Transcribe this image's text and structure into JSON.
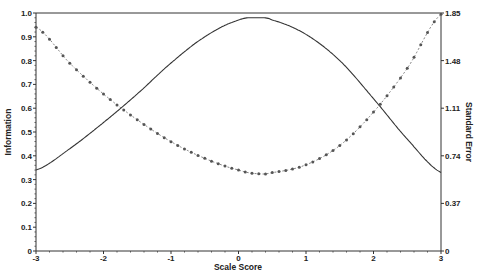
{
  "chart_data": {
    "type": "line",
    "title": "",
    "xlabel": "Scale Score",
    "ylabel": "Information",
    "y2label": "Standard Error",
    "xlim": [
      -3,
      3
    ],
    "ylim": [
      0,
      1.0
    ],
    "y2lim": [
      0,
      1.85
    ],
    "xticks": [
      "-3",
      "-2",
      "-1",
      "0",
      "1",
      "2",
      "3"
    ],
    "yticks": [
      "0",
      "0.1",
      "0.2",
      "0.3",
      "0.4",
      "0.5",
      "0.6",
      "0.7",
      "0.8",
      "0.9",
      "1.0"
    ],
    "y2ticks": [
      "0",
      "0.37",
      "0.74",
      "1.11",
      "1.48",
      "1.85"
    ],
    "grid": false,
    "legend": null,
    "x": [
      -3,
      -2.5,
      -2,
      -1.5,
      -1,
      -0.5,
      0,
      0.3,
      0.5,
      1,
      1.5,
      2,
      2.5,
      3
    ],
    "series": [
      {
        "name": "Information",
        "axis": "left",
        "style": "solid",
        "values": [
          0.34,
          0.43,
          0.54,
          0.66,
          0.79,
          0.9,
          0.97,
          0.98,
          0.97,
          0.91,
          0.8,
          0.64,
          0.47,
          0.33
        ]
      },
      {
        "name": "Standard Error",
        "axis": "right",
        "style": "dotted-markers",
        "values": [
          1.74,
          1.46,
          1.22,
          1.02,
          0.85,
          0.72,
          0.63,
          0.6,
          0.61,
          0.67,
          0.82,
          1.08,
          1.42,
          1.84
        ]
      }
    ]
  }
}
